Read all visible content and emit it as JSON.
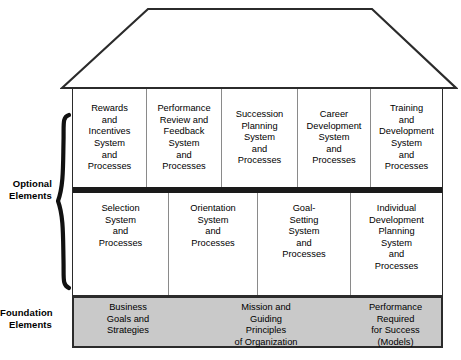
{
  "diagram": {
    "colors": {
      "foundation_fill": "#c9c9c9",
      "outline": "#2b2b2b",
      "divider_bar": "#1a1a1a",
      "cell_divider": "#8a8a8a",
      "background": "#ffffff"
    },
    "roof": {
      "name": "roof-shape",
      "shape": "trapezoid"
    },
    "side_labels": {
      "optional": "Optional\nElements",
      "foundation": "Foundation\nElements"
    },
    "brace": {
      "name": "curly-brace",
      "spans": "optional-elements-tiers"
    },
    "optional_elements": {
      "top_row": [
        {
          "text": "Rewards\nand\nIncentives\nSystem\nand\nProcesses"
        },
        {
          "text": "Performance\nReview and\nFeedback\nSystem\nand\nProcesses"
        },
        {
          "text": "Succession\nPlanning\nSystem\nand\nProcesses"
        },
        {
          "text": "Career\nDevelopment\nSystem\nand\nProcesses"
        },
        {
          "text": "Training\nand\nDevelopment\nSystem\nand\nProcesses"
        }
      ],
      "bottom_row": [
        {
          "text": "Selection\nSystem\nand\nProcesses"
        },
        {
          "text": "Orientation\nSystem\nand\nProcesses"
        },
        {
          "text": "Goal-\nSetting\nSystem\nand\nProcesses"
        },
        {
          "text": "Individual\nDevelopment\nPlanning\nSystem\nand\nProcesses"
        }
      ]
    },
    "foundation_elements": [
      {
        "text": "Business\nGoals and\nStrategies"
      },
      {
        "text": "Mission and\nGuiding\nPrinciples\nof Organization"
      },
      {
        "text": "Performance\nRequired\nfor Success\n(Models)"
      }
    ]
  }
}
